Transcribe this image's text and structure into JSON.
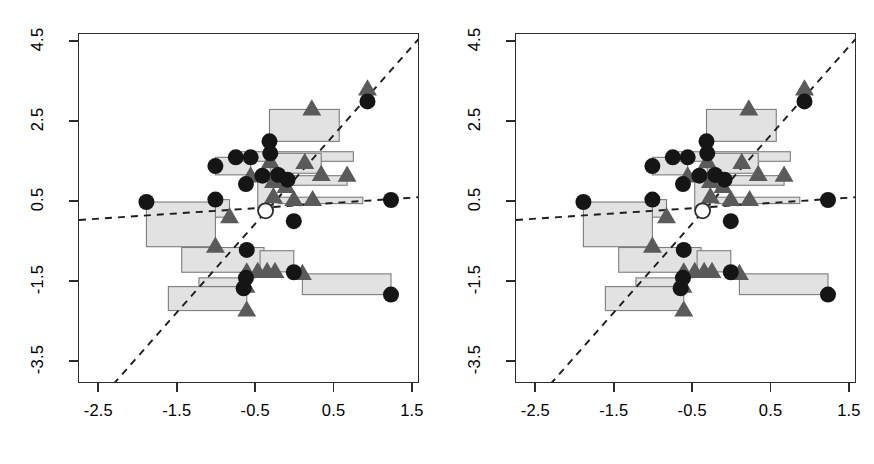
{
  "figure": {
    "type": "two-panel-scatter",
    "panel_count": 2,
    "background": "#ffffff"
  },
  "colors": {
    "box_fill": "#e2e2e2",
    "box_stroke": "#7d7d7d",
    "circle_filled": "#151515",
    "circle_open_stroke": "#2d2d2d",
    "triangle": "#5a5a5a",
    "line": "#1d1d1d",
    "axis": "#2b2b2b"
  },
  "geometry": {
    "panel_width": 437,
    "panel_height": 464,
    "plot_left": 78,
    "plot_top": 33,
    "plot_width": 341,
    "plot_height": 350
  },
  "chart_data": {
    "type": "scatter",
    "title": "",
    "xlabel": "",
    "ylabel": "",
    "xlim": [
      -2.76,
      1.59
    ],
    "ylim": [
      -4.06,
      4.71
    ],
    "xticks": [
      -2.5,
      -1.5,
      -0.5,
      0.5,
      1.5
    ],
    "xticklabels": [
      "-2.5",
      "-1.5",
      "-0.5",
      "0.5",
      "1.5"
    ],
    "yticks": [
      -3.5,
      -1.5,
      0.5,
      2.5,
      4.5
    ],
    "yticklabels": [
      "-3.5",
      "-1.5",
      "0.5",
      "2.5",
      "4.5"
    ],
    "grid": false,
    "legend": null,
    "marker_types": [
      "filled-circle",
      "open-circle",
      "triangle-up",
      "rectangle"
    ],
    "series": [
      {
        "name": "rectangles",
        "description": "light grey rectangle spanning x1..x2 and y1..y2",
        "values": [
          {
            "x1": -0.33,
            "x2": 0.56,
            "y1": 2.02,
            "y2": 2.82
          },
          {
            "x1": -1.02,
            "x2": -0.57,
            "y1": 1.18,
            "y2": 1.62
          },
          {
            "x1": -0.76,
            "x2": 0.74,
            "y1": 1.52,
            "y2": 1.76
          },
          {
            "x1": -0.32,
            "x2": 0.33,
            "y1": 1.22,
            "y2": 1.72
          },
          {
            "x1": -0.42,
            "x2": 0.66,
            "y1": 0.92,
            "y2": 1.16
          },
          {
            "x1": -0.48,
            "x2": -0.28,
            "y1": 0.3,
            "y2": 1.22
          },
          {
            "x1": -0.22,
            "x2": 0.86,
            "y1": 0.46,
            "y2": 0.62
          },
          {
            "x1": -1.02,
            "x2": -0.84,
            "y1": 0.12,
            "y2": 0.56
          },
          {
            "x1": -1.9,
            "x2": -1.02,
            "y1": -0.62,
            "y2": 0.5
          },
          {
            "x1": -1.45,
            "x2": -0.4,
            "y1": -1.26,
            "y2": -0.64
          },
          {
            "x1": -0.45,
            "x2": -0.02,
            "y1": -1.25,
            "y2": -0.72
          },
          {
            "x1": 0.09,
            "x2": 1.22,
            "y1": -1.82,
            "y2": -1.3
          },
          {
            "x1": -1.23,
            "x2": -0.63,
            "y1": -1.62,
            "y2": -1.4
          },
          {
            "x1": -1.62,
            "x2": -0.62,
            "y1": -2.22,
            "y2": -1.62
          }
        ]
      },
      {
        "name": "filled-circles",
        "description": "dark filled circle at upper-left vertex of each rectangle",
        "values": [
          {
            "x": 0.92,
            "y": 3.02
          },
          {
            "x": -0.33,
            "y": 2.02
          },
          {
            "x": -0.57,
            "y": 1.62
          },
          {
            "x": -0.76,
            "y": 1.62
          },
          {
            "x": -1.02,
            "y": 1.4
          },
          {
            "x": -0.32,
            "y": 1.72
          },
          {
            "x": -0.22,
            "y": 1.18
          },
          {
            "x": -0.1,
            "y": 1.06
          },
          {
            "x": -0.42,
            "y": 1.16
          },
          {
            "x": -0.63,
            "y": 0.95
          },
          {
            "x": -1.02,
            "y": 0.56
          },
          {
            "x": 1.22,
            "y": 0.55
          },
          {
            "x": -1.9,
            "y": 0.5
          },
          {
            "x": -0.02,
            "y": 0.02
          },
          {
            "x": -0.62,
            "y": -0.7
          },
          {
            "x": -0.02,
            "y": -1.26
          },
          {
            "x": -0.63,
            "y": -1.4
          },
          {
            "x": -0.66,
            "y": -1.66
          },
          {
            "x": 1.22,
            "y": -1.82
          }
        ]
      },
      {
        "name": "open-circle",
        "description": "single white/unfilled circle",
        "values": [
          {
            "x": -0.38,
            "y": 0.28
          }
        ]
      },
      {
        "name": "triangles",
        "description": "grey up-triangle at lower-right vertex of each rectangle",
        "values": [
          {
            "x": 0.92,
            "y": 3.32
          },
          {
            "x": 0.21,
            "y": 2.82
          },
          {
            "x": -0.57,
            "y": 1.14
          },
          {
            "x": -0.32,
            "y": 1.5
          },
          {
            "x": 0.12,
            "y": 1.48
          },
          {
            "x": 0.33,
            "y": 1.18
          },
          {
            "x": 0.66,
            "y": 1.16
          },
          {
            "x": -0.28,
            "y": 1.0
          },
          {
            "x": -0.12,
            "y": 0.88
          },
          {
            "x": -0.28,
            "y": 0.62
          },
          {
            "x": -0.02,
            "y": 0.55
          },
          {
            "x": 0.22,
            "y": 0.55
          },
          {
            "x": -0.84,
            "y": 0.12
          },
          {
            "x": -1.02,
            "y": -0.62
          },
          {
            "x": -0.62,
            "y": -1.26
          },
          {
            "x": -0.48,
            "y": -1.25
          },
          {
            "x": -0.36,
            "y": -1.25
          },
          {
            "x": -0.26,
            "y": -1.25
          },
          {
            "x": 0.09,
            "y": -1.3
          },
          {
            "x": -0.63,
            "y": -1.62
          },
          {
            "x": -0.62,
            "y": -2.22
          }
        ]
      },
      {
        "name": "fit-line-steep",
        "description": "dashed line with steep positive slope",
        "type": "line",
        "endpoints": [
          {
            "x": -2.32,
            "y": -4.06
          },
          {
            "x": 1.58,
            "y": 4.6
          }
        ]
      },
      {
        "name": "fit-line-shallow",
        "description": "dashed line with shallow positive slope",
        "type": "line",
        "endpoints": [
          {
            "x": -2.76,
            "y": 0.05
          },
          {
            "x": 1.58,
            "y": 0.62
          }
        ]
      }
    ]
  }
}
